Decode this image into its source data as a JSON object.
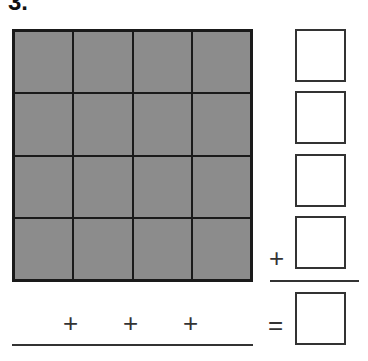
{
  "problem": {
    "number_label": "3."
  },
  "grid": {
    "rows": 4,
    "cols": 4,
    "fill_color": "#8c8c8c",
    "line_color": "#1a1a1a"
  },
  "row_sum_boxes": [
    {
      "value": ""
    },
    {
      "value": ""
    },
    {
      "value": ""
    },
    {
      "value": ""
    }
  ],
  "column_plus_signs": [
    "+",
    "+",
    "+"
  ],
  "row_plus_sign": "+",
  "equals_sign": "=",
  "total_box": {
    "value": ""
  }
}
